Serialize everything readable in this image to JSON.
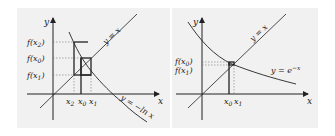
{
  "colors": {
    "background": "#ffffff",
    "panel_background": "#f1f1f1",
    "ink": "#222222",
    "guide": "#777777"
  },
  "panels": [
    {
      "id": "left",
      "axis_x_label": "x",
      "axis_y_label": "y",
      "curve_identity_label": "y = x",
      "curve_function_label": "y = −ln x",
      "y_tick_labels": [
        {
          "base": "f(x",
          "sub": "2",
          "close": ")"
        },
        {
          "base": "f(x",
          "sub": "0",
          "close": ")"
        },
        {
          "base": "f(x",
          "sub": "1",
          "close": ")"
        }
      ],
      "x_tick_labels": [
        {
          "base": "x",
          "sub": "2"
        },
        {
          "base": "x",
          "sub": "0"
        },
        {
          "base": "x",
          "sub": "1"
        }
      ]
    },
    {
      "id": "right",
      "axis_x_label": "x",
      "axis_y_label": "y",
      "curve_identity_label": "y = x",
      "curve_function_label": "y = e",
      "curve_function_exponent": "−x",
      "y_tick_labels": [
        {
          "base": "f(x",
          "sub": "0",
          "close": ")"
        },
        {
          "base": "f(x",
          "sub": "1",
          "close": ")"
        }
      ],
      "x_tick_labels": [
        {
          "base": "x",
          "sub": "0"
        },
        {
          "base": "x",
          "sub": "1"
        }
      ]
    }
  ]
}
